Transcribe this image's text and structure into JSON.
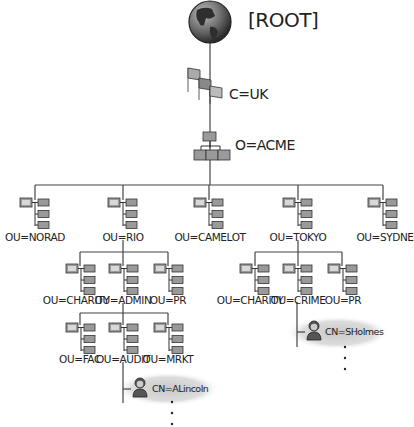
{
  "root": {
    "label": "[ROOT]",
    "icon": "globe-icon"
  },
  "country": {
    "label": "C=UK",
    "icon": "flags-icon"
  },
  "organization": {
    "label": "O=ACME",
    "icon": "org-chart-icon"
  },
  "ous_level1": [
    {
      "label": "OU=NORAD",
      "icon": "ou-icon"
    },
    {
      "label": "OU=RIO",
      "icon": "ou-icon"
    },
    {
      "label": "OU=CAMELOT",
      "icon": "ou-icon"
    },
    {
      "label": "OU=TOKYO",
      "icon": "ou-icon"
    },
    {
      "label": "OU=SYDNE",
      "icon": "ou-icon"
    }
  ],
  "rio_children": [
    {
      "label": "OU=CHARITY"
    },
    {
      "label": "OU=ADMIN"
    },
    {
      "label": "OU=PR"
    }
  ],
  "tokyo_children": [
    {
      "label": "OU=CHARITY"
    },
    {
      "label": "OU=CRIME"
    },
    {
      "label": "OU=PR"
    }
  ],
  "admin_children": [
    {
      "label": "OU=FAC"
    },
    {
      "label": "OU=AUDIT"
    },
    {
      "label": "OU=MRKT"
    }
  ],
  "users": [
    {
      "label": "CN=ALincoln",
      "parent": "OU=AUDIT",
      "icon": "user-icon"
    },
    {
      "label": "CN=SHolmes",
      "parent": "OU=CRIME",
      "icon": "user-icon"
    }
  ],
  "continuation": "..."
}
